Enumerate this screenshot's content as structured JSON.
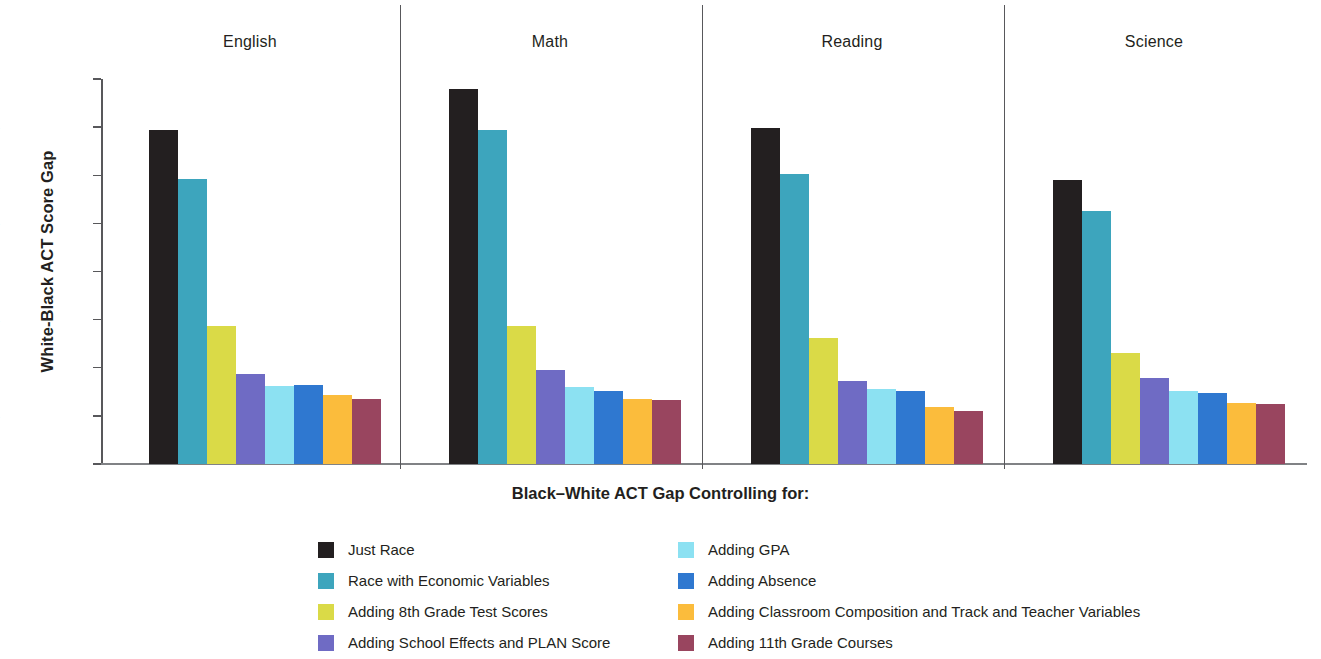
{
  "chart_data": {
    "type": "bar",
    "title": "",
    "xlabel": "Black–White ACT Gap Controlling for:",
    "ylabel": "White-Black ACT Score Gap",
    "ylim": [
      0,
      4.0
    ],
    "ytick_labels": [
      "4.0",
      "3.5",
      "3.0",
      "2.5",
      "2.0",
      "1.5",
      "1.0",
      "0.5",
      "0"
    ],
    "ytick_values": [
      4.0,
      3.5,
      3.0,
      2.5,
      2.0,
      1.5,
      1.0,
      0.5,
      0
    ],
    "grid": false,
    "legend_position": "bottom",
    "panels": [
      "English",
      "Math",
      "Reading",
      "Science"
    ],
    "categories": [
      "English",
      "Math",
      "Reading",
      "Science"
    ],
    "series": [
      {
        "name": "Just Race",
        "color": "#231f20",
        "values": [
          3.47,
          3.9,
          3.49,
          2.95
        ]
      },
      {
        "name": "Race with Economic Variables",
        "color": "#3da5bd",
        "values": [
          2.96,
          3.47,
          3.01,
          2.63
        ]
      },
      {
        "name": "Adding 8th Grade Test Scores",
        "color": "#dada47",
        "values": [
          1.43,
          1.43,
          1.31,
          1.15
        ]
      },
      {
        "name": "Adding School Effects and PLAN Score",
        "color": "#6f6bc4",
        "values": [
          0.94,
          0.98,
          0.86,
          0.89
        ]
      },
      {
        "name": "Adding GPA",
        "color": "#8ce1f2",
        "values": [
          0.81,
          0.8,
          0.78,
          0.76
        ]
      },
      {
        "name": "Adding Absence",
        "color": "#2f78d0",
        "values": [
          0.82,
          0.76,
          0.76,
          0.74
        ]
      },
      {
        "name": "Adding Classroom Composition and Track and Teacher Variables",
        "color": "#fbbc3c",
        "values": [
          0.72,
          0.68,
          0.59,
          0.63
        ]
      },
      {
        "name": "Adding 11th Grade Courses",
        "color": "#99455f",
        "values": [
          0.68,
          0.66,
          0.55,
          0.62
        ]
      }
    ]
  },
  "axis": {
    "y_title": "White-Black ACT Score Gap",
    "x_title": "Black–White ACT Gap Controlling for:"
  },
  "legend": {
    "left_column": [
      {
        "label": "Just Race",
        "color": "#231f20"
      },
      {
        "label": "Race with Economic Variables",
        "color": "#3da5bd"
      },
      {
        "label": "Adding 8th Grade Test Scores",
        "color": "#dada47"
      },
      {
        "label": "Adding School Effects and PLAN Score",
        "color": "#6f6bc4"
      }
    ],
    "right_column": [
      {
        "label": "Adding GPA",
        "color": "#8ce1f2"
      },
      {
        "label": "Adding Absence",
        "color": "#2f78d0"
      },
      {
        "label": "Adding Classroom Composition and Track and Teacher Variables",
        "color": "#fbbc3c"
      },
      {
        "label": "Adding 11th Grade Courses",
        "color": "#99455f"
      }
    ]
  }
}
